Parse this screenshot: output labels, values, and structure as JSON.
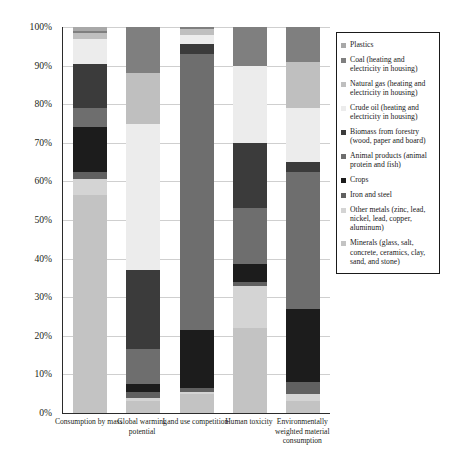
{
  "chart_data": {
    "type": "bar",
    "subtype": "stacked-percentage",
    "title": "",
    "xlabel": "",
    "ylabel": "",
    "ylim": [
      0,
      100
    ],
    "ytick_labels": [
      "0%",
      "10%",
      "20%",
      "30%",
      "40%",
      "50%",
      "60%",
      "70%",
      "80%",
      "90%",
      "100%"
    ],
    "ytick_values": [
      0,
      10,
      20,
      30,
      40,
      50,
      60,
      70,
      80,
      90,
      100
    ],
    "grid": true,
    "legend_position": "right",
    "categories": [
      "Consumption by mass",
      "Global warming potential",
      "Land use competition",
      "Human toxicity",
      "Environmentally weighted material consumption"
    ],
    "series": [
      {
        "name": "Plastics",
        "color": "#a8a8a8",
        "values": [
          1.0,
          0.0,
          0.0,
          0.0,
          0.0
        ]
      },
      {
        "name": "Coal (heating and electricity in housing)",
        "color": "#7f7f7f",
        "values": [
          0.5,
          12.0,
          0.5,
          10.0,
          9.0
        ]
      },
      {
        "name": "Natural gas (heating and electricity in housing)",
        "color": "#bfbfbf",
        "values": [
          1.5,
          13.0,
          1.5,
          0.0,
          12.0
        ]
      },
      {
        "name": "Crude oil (heating and electricity in housing)",
        "color": "#ececec",
        "values": [
          6.5,
          38.0,
          2.5,
          20.0,
          14.0
        ]
      },
      {
        "name": "Biomass from forestry (wood, paper and board)",
        "color": "#3b3b3b",
        "values": [
          11.5,
          20.5,
          2.5,
          17.0,
          2.5
        ]
      },
      {
        "name": "Animal products (animal protein and fish)",
        "color": "#6e6e6e",
        "values": [
          5.0,
          9.0,
          71.5,
          14.5,
          35.5
        ]
      },
      {
        "name": "Crops",
        "color": "#1c1c1c",
        "values": [
          11.5,
          2.0,
          15.0,
          4.5,
          19.0
        ]
      },
      {
        "name": "Iron and steel",
        "color": "#606060",
        "values": [
          2.0,
          1.5,
          1.0,
          1.0,
          3.0
        ]
      },
      {
        "name": "Other metals (zinc, lead, nickel, lead, copper, aluminum)",
        "color": "#d4d4d4",
        "values": [
          4.0,
          1.0,
          0.5,
          11.0,
          2.0
        ]
      },
      {
        "name": "Minerals (glass, salt, concrete, ceramics, clay, sand, and stone)",
        "color": "#c3c3c3",
        "values": [
          56.5,
          3.0,
          5.0,
          22.0,
          3.0
        ]
      }
    ]
  },
  "legend": {
    "items": [
      {
        "label": "Plastics",
        "color": "#a8a8a8"
      },
      {
        "label": "Coal (heating and electricity in housing)",
        "color": "#7f7f7f"
      },
      {
        "label": "Natural gas (heating and electricity in housing)",
        "color": "#bfbfbf"
      },
      {
        "label": "Crude oil (heating and electricity in housing)",
        "color": "#ececec"
      },
      {
        "label": "Biomass from forestry (wood, paper and board)",
        "color": "#3b3b3b"
      },
      {
        "label": "Animal products (animal protein and fish)",
        "color": "#6e6e6e"
      },
      {
        "label": "Crops",
        "color": "#1c1c1c"
      },
      {
        "label": "Iron and steel",
        "color": "#606060"
      },
      {
        "label": "Other metals (zinc, lead, nickel, lead, copper, aluminum)",
        "color": "#d4d4d4"
      },
      {
        "label": "Minerals (glass, salt, concrete, ceramics, clay, sand, and stone)",
        "color": "#c3c3c3"
      }
    ]
  },
  "axis": {
    "line_color": "#2b2b2b",
    "grid_color": "#cfcfcf"
  }
}
